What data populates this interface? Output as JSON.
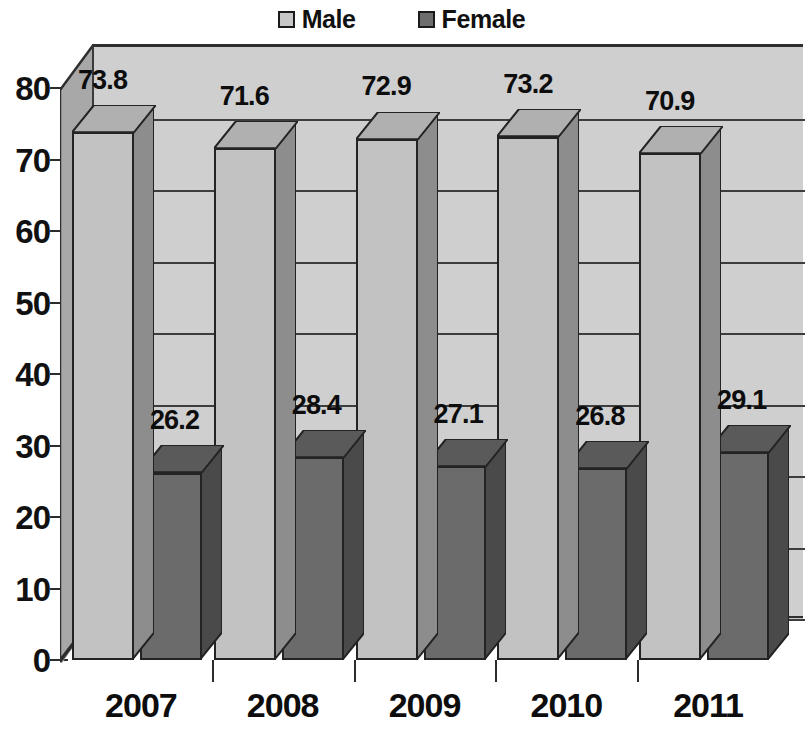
{
  "chart_data": {
    "type": "bar",
    "title": "",
    "subtitle": "",
    "xlabel": "",
    "ylabel": "",
    "categories": [
      "2007",
      "2008",
      "2009",
      "2010",
      "2011"
    ],
    "series": [
      {
        "name": "Male",
        "values": [
          73.8,
          71.6,
          72.9,
          73.2,
          70.9
        ],
        "color": "#c2c2c2"
      },
      {
        "name": "Female",
        "values": [
          26.2,
          28.4,
          27.1,
          26.8,
          29.1
        ],
        "color": "#6b6b6b"
      }
    ],
    "ylim": [
      0,
      80
    ],
    "ytick_labels": [
      "0",
      "10",
      "20",
      "30",
      "40",
      "50",
      "60",
      "70",
      "80"
    ],
    "ytick_values": [
      0,
      10,
      20,
      30,
      40,
      50,
      60,
      70,
      80
    ],
    "grid": true,
    "grid_axis": "y",
    "legend": true,
    "legend_position": "top-center",
    "data_labels": true,
    "three_d": true,
    "plot_background": "#cfcfcf",
    "axis_color": "#2c2c2c"
  },
  "legend": {
    "entries": [
      {
        "label": "Male",
        "swatch": "legend-swatch-male"
      },
      {
        "label": "Female",
        "swatch": "legend-swatch-female"
      }
    ]
  }
}
